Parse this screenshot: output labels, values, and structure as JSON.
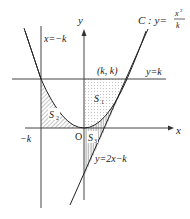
{
  "diagram": {
    "title": "",
    "axes": {
      "x_label": "x",
      "y_label": "y",
      "origin_label": "O"
    },
    "curve": {
      "name": "C",
      "label_prefix": "C : y=",
      "numerator": "x",
      "numerator_exp": "2",
      "denominator": "k"
    },
    "lines": {
      "vertical": "x=−k",
      "horizontal": "y=k",
      "tangent": "y=2x−k"
    },
    "points": {
      "tangent_point": "(k,  k)"
    },
    "ticks": {
      "neg_k": "−k"
    },
    "regions": [
      {
        "label": "S",
        "sub": "2",
        "fill": "hatched-diagonal",
        "description": "between x=−k, x-axis and curve C"
      },
      {
        "label": "S",
        "sub": "1",
        "fill": "dotted",
        "description": "between y-axis, y=k and curve C"
      },
      {
        "label": "S",
        "sub": "3",
        "fill": "hatched-vertical",
        "description": "between curve C, tangent line and x-axis"
      }
    ],
    "colors": {
      "line": "#333333",
      "axis": "#444444",
      "hatch": "#555555",
      "dot": "#888888"
    }
  }
}
